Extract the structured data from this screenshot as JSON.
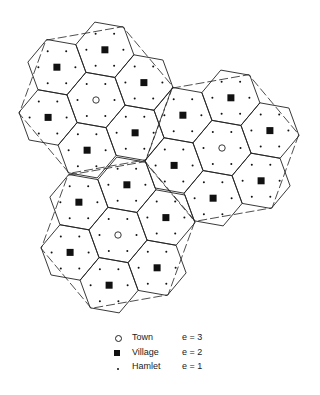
{
  "chart_data": {
    "type": "diagram",
    "title": "",
    "geometry": {
      "hex_spacing": 51,
      "lattice_angle_deg": 40,
      "hex_vertex_radius": 29.5,
      "hex_vertex_angle_offset_deg": 10,
      "hamlet_radius": 18.5,
      "hamlet_angle_offset_deg": 0,
      "market_area_radius": 78,
      "market_area_angle_offset_deg": -10
    },
    "towns": [
      {
        "x": 96,
        "y": 100
      },
      {
        "x": 222,
        "y": 148
      },
      {
        "x": 118,
        "y": 235
      }
    ],
    "counts": {
      "towns": 3,
      "villages": 18,
      "hamlets": 126,
      "hexagons": 21
    }
  },
  "legend": {
    "items": [
      {
        "symbol": "open-circle",
        "label": "Town",
        "value": "e = 3"
      },
      {
        "symbol": "filled-square",
        "label": "Village",
        "value": "e = 2"
      },
      {
        "symbol": "small-dot",
        "label": "Hamlet",
        "value": "e = 1"
      }
    ]
  },
  "colors": {
    "line": "#222222",
    "fill": "#111111",
    "background": "#ffffff"
  }
}
